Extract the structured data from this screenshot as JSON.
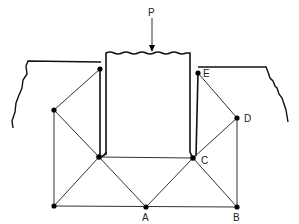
{
  "diagram": {
    "title": "",
    "load": {
      "label": "P",
      "direction": "down"
    },
    "nodes": [
      {
        "id": "A",
        "label": "A",
        "x": 146,
        "y": 207
      },
      {
        "id": "B",
        "label": "B",
        "x": 237,
        "y": 207
      },
      {
        "id": "C",
        "label": "C",
        "x": 193,
        "y": 158
      },
      {
        "id": "D",
        "label": "D",
        "x": 237,
        "y": 118
      },
      {
        "id": "E",
        "label": "E",
        "x": 198,
        "y": 73
      }
    ],
    "colors": {
      "line": "#333333",
      "node": "#000000",
      "background": "#ffffff"
    }
  }
}
